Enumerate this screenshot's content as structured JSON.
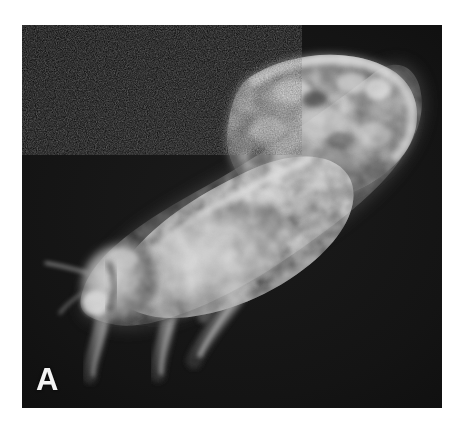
{
  "figure": {
    "panel_label": "A",
    "background_color": "#ffffff",
    "plate": {
      "x": 22,
      "y": 25,
      "width": 420,
      "height": 383,
      "field_color": "#101010",
      "grain": "photographic-noise"
    },
    "image_type": "grayscale fluorescence micrograph",
    "orientation": "head at lower-left, abdomen tip at upper-right, body axis ~35 degrees",
    "intensity": {
      "background_min": "#070707",
      "background_max": "#1e1e1e",
      "specimen_mid": "#6e6e6e",
      "specimen_bright": "#c8c8c8",
      "specimen_peak": "#e2e2e2",
      "label_color": "#f4f4f4"
    },
    "anatomy": [
      {
        "name": "abdomen",
        "note": "broad rounded distal end, upper right, mottled bright signal"
      },
      {
        "name": "wing-pad",
        "note": "elongate diagonal band with longitudinal striations"
      },
      {
        "name": "thorax",
        "note": "mid body, bright granular patches"
      },
      {
        "name": "head",
        "note": "lower-left, bright lobed capsule"
      },
      {
        "name": "antenna",
        "note": "thin filament projecting left from head"
      },
      {
        "name": "foreleg",
        "note": "descending from head region"
      },
      {
        "name": "midleg",
        "note": "central descending leg"
      },
      {
        "name": "hindleg",
        "note": "long posterior leg angled down-left"
      }
    ]
  }
}
